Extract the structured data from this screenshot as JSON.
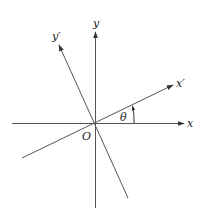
{
  "diagram": {
    "colors": {
      "line": "#555555",
      "text": "#222222",
      "background": "#ffffff"
    },
    "origin": {
      "label": "O",
      "x": 95.5,
      "y": 123.5
    },
    "axes": [
      {
        "id": "x",
        "label": "x",
        "from": [
          12,
          123.5
        ],
        "to": [
          184,
          123.5
        ]
      },
      {
        "id": "y",
        "label": "y",
        "from": [
          95.5,
          208
        ],
        "to": [
          95.5,
          32
        ]
      },
      {
        "id": "x-prime",
        "label": "x′",
        "from": [
          22,
          158
        ],
        "to": [
          173,
          85
        ]
      },
      {
        "id": "y-prime",
        "label": "y′",
        "from": [
          128,
          198
        ],
        "to": [
          59,
          45
        ]
      }
    ],
    "angle": {
      "label": "θ",
      "between": [
        "x",
        "x-prime"
      ]
    }
  }
}
